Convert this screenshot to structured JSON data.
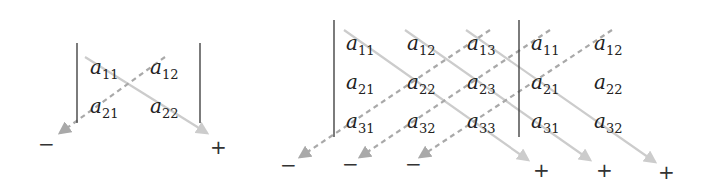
{
  "colors": {
    "positive_arrow": "#cccccc",
    "negative_arrow": "#a9a9a9",
    "bar": "#444444",
    "text": "#222222"
  },
  "diagram_2x2": {
    "label": "2x2 determinant",
    "bars": [
      {
        "x": 77,
        "y1": 43,
        "y2": 123
      },
      {
        "x": 200,
        "y1": 43,
        "y2": 123
      }
    ],
    "entries": [
      {
        "base": "a",
        "sub": "11",
        "x": 90,
        "y": 74
      },
      {
        "base": "a",
        "sub": "12",
        "x": 150,
        "y": 74
      },
      {
        "base": "a",
        "sub": "21",
        "x": 90,
        "y": 113
      },
      {
        "base": "a",
        "sub": "22",
        "x": 150,
        "y": 113
      }
    ],
    "arrows": [
      {
        "type": "positive",
        "x1": 85,
        "y1": 57,
        "x2": 207,
        "y2": 133
      },
      {
        "type": "negative",
        "x1": 165,
        "y1": 57,
        "x2": 60,
        "y2": 133
      }
    ],
    "signs": [
      {
        "text": "−",
        "x": 38,
        "y": 151
      },
      {
        "text": "+",
        "x": 210,
        "y": 154
      }
    ]
  },
  "diagram_3x3": {
    "label": "3x3 determinant (rule of Sarrus)",
    "bars": [
      {
        "x": 334,
        "y1": 20,
        "y2": 137
      },
      {
        "x": 519,
        "y1": 20,
        "y2": 137
      }
    ],
    "entries": [
      {
        "base": "a",
        "sub": "11",
        "x": 346,
        "y": 50
      },
      {
        "base": "a",
        "sub": "12",
        "x": 407,
        "y": 50
      },
      {
        "base": "a",
        "sub": "13",
        "x": 467,
        "y": 50
      },
      {
        "base": "a",
        "sub": "11",
        "x": 531,
        "y": 50
      },
      {
        "base": "a",
        "sub": "12",
        "x": 594,
        "y": 50
      },
      {
        "base": "a",
        "sub": "21",
        "x": 346,
        "y": 89
      },
      {
        "base": "a",
        "sub": "22",
        "x": 407,
        "y": 89
      },
      {
        "base": "a",
        "sub": "23",
        "x": 467,
        "y": 89
      },
      {
        "base": "a",
        "sub": "21",
        "x": 531,
        "y": 89
      },
      {
        "base": "a",
        "sub": "22",
        "x": 594,
        "y": 89
      },
      {
        "base": "a",
        "sub": "31",
        "x": 346,
        "y": 128
      },
      {
        "base": "a",
        "sub": "32",
        "x": 407,
        "y": 128
      },
      {
        "base": "a",
        "sub": "33",
        "x": 467,
        "y": 128
      },
      {
        "base": "a",
        "sub": "31",
        "x": 531,
        "y": 128
      },
      {
        "base": "a",
        "sub": "32",
        "x": 594,
        "y": 128
      }
    ],
    "arrows": [
      {
        "type": "positive",
        "x1": 344,
        "y1": 30,
        "x2": 528,
        "y2": 160
      },
      {
        "type": "positive",
        "x1": 405,
        "y1": 30,
        "x2": 590,
        "y2": 160
      },
      {
        "type": "positive",
        "x1": 466,
        "y1": 30,
        "x2": 655,
        "y2": 162
      },
      {
        "type": "negative",
        "x1": 490,
        "y1": 30,
        "x2": 300,
        "y2": 157
      },
      {
        "type": "negative",
        "x1": 550,
        "y1": 30,
        "x2": 360,
        "y2": 157
      },
      {
        "type": "negative",
        "x1": 612,
        "y1": 30,
        "x2": 420,
        "y2": 157
      }
    ],
    "signs": [
      {
        "text": "−",
        "x": 280,
        "y": 172
      },
      {
        "text": "−",
        "x": 342,
        "y": 171
      },
      {
        "text": "−",
        "x": 405,
        "y": 171
      },
      {
        "text": "+",
        "x": 533,
        "y": 177
      },
      {
        "text": "+",
        "x": 596,
        "y": 177
      },
      {
        "text": "+",
        "x": 658,
        "y": 179
      }
    ]
  }
}
